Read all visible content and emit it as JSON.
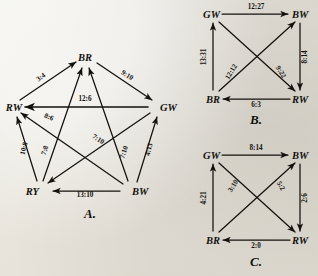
{
  "figure": {
    "background_color": "#e9e6df",
    "ink_color": "#14110d"
  },
  "panels": [
    {
      "id": "A",
      "caption": "A.",
      "shape": "pentagon-with-pentagram",
      "nodes": [
        {
          "id": "BR",
          "label": "BR",
          "x": 85,
          "y": 58
        },
        {
          "id": "GW",
          "label": "GW",
          "x": 158,
          "y": 107
        },
        {
          "id": "BW",
          "label": "BW",
          "x": 130,
          "y": 190
        },
        {
          "id": "RY",
          "label": "RY",
          "x": 41,
          "y": 190
        },
        {
          "id": "RW",
          "label": "RW",
          "x": 13,
          "y": 107
        }
      ],
      "edges": [
        {
          "from": "RW",
          "to": "BR",
          "label": "3:4",
          "lx": 42,
          "ly": 79,
          "rot": -35
        },
        {
          "from": "BR",
          "to": "GW",
          "label": "9:10",
          "lx": 126,
          "ly": 77,
          "rot": 33
        },
        {
          "from": "GW",
          "to": "RW",
          "label": "12:6",
          "lx": 85,
          "ly": 100,
          "rot": 0
        },
        {
          "from": "GW",
          "to": "RY",
          "label": "7:10",
          "lx": 97,
          "ly": 140,
          "rot": 33
        },
        {
          "from": "RY",
          "to": "RW",
          "label": "10:8",
          "lx": 25,
          "ly": 148,
          "rot": -76
        },
        {
          "from": "BW",
          "to": "RY",
          "label": "13:10",
          "lx": 85,
          "ly": 197,
          "rot": 0
        },
        {
          "from": "BW",
          "to": "GW",
          "label": "4:13",
          "lx": 150,
          "ly": 150,
          "rot": -76
        },
        {
          "from": "BW",
          "to": "BR",
          "label": "7:10",
          "lx": 126,
          "ly": 152,
          "rot": -72
        },
        {
          "from": "RY",
          "to": "BR",
          "label": "7:8",
          "lx": 46,
          "ly": 150,
          "rot": -72
        },
        {
          "from": "BW",
          "to": "RW",
          "label": "8:6",
          "lx": 47,
          "ly": 118,
          "rot": 22
        }
      ]
    },
    {
      "id": "B",
      "caption": "B.",
      "shape": "square-with-diagonals",
      "nodes": [
        {
          "id": "GW",
          "label": "GW",
          "x": 212,
          "y": 14
        },
        {
          "id": "BW",
          "label": "BW",
          "x": 300,
          "y": 14
        },
        {
          "id": "BR",
          "label": "BR",
          "x": 212,
          "y": 99
        },
        {
          "id": "RW",
          "label": "RW",
          "x": 300,
          "y": 99
        }
      ],
      "edges": [
        {
          "from": "GW",
          "to": "BW",
          "label": "12:27",
          "lx": 256,
          "ly": 8,
          "rot": 0
        },
        {
          "from": "BR",
          "to": "GW",
          "label": "13:31",
          "lx": 204,
          "ly": 56,
          "rot": -90
        },
        {
          "from": "BW",
          "to": "RW",
          "label": "8:14",
          "lx": 308,
          "ly": 56,
          "rot": -90
        },
        {
          "from": "RW",
          "to": "BR",
          "label": "6:3",
          "lx": 256,
          "ly": 106,
          "rot": 0
        },
        {
          "from": "GW",
          "to": "RW",
          "label": "12:12",
          "lx": 232,
          "ly": 72,
          "rot": -55
        },
        {
          "from": "BR",
          "to": "BW",
          "label": "9:22",
          "lx": 278,
          "ly": 72,
          "rot": 55
        }
      ]
    },
    {
      "id": "C",
      "caption": "C.",
      "shape": "square-with-diagonals",
      "nodes": [
        {
          "id": "GW",
          "label": "GW",
          "x": 212,
          "y": 155
        },
        {
          "id": "BW",
          "label": "BW",
          "x": 300,
          "y": 155
        },
        {
          "id": "BR",
          "label": "BR",
          "x": 212,
          "y": 240
        },
        {
          "id": "RW",
          "label": "RW",
          "x": 300,
          "y": 240
        }
      ],
      "edges": [
        {
          "from": "GW",
          "to": "BW",
          "label": "8:14",
          "lx": 256,
          "ly": 149,
          "rot": 0
        },
        {
          "from": "BR",
          "to": "GW",
          "label": "4:21",
          "lx": 204,
          "ly": 197,
          "rot": -90
        },
        {
          "from": "BW",
          "to": "RW",
          "label": "2:6",
          "lx": 308,
          "ly": 197,
          "rot": -90
        },
        {
          "from": "RW",
          "to": "BR",
          "label": "2:0",
          "lx": 256,
          "ly": 247,
          "rot": 0
        },
        {
          "from": "GW",
          "to": "RW",
          "label": "3:10",
          "lx": 234,
          "ly": 186,
          "rot": -55
        },
        {
          "from": "BR",
          "to": "BW",
          "label": "5:2",
          "lx": 278,
          "ly": 186,
          "rot": 55
        }
      ]
    }
  ],
  "captions": {
    "a": "A.",
    "b": "B.",
    "c": "C."
  }
}
